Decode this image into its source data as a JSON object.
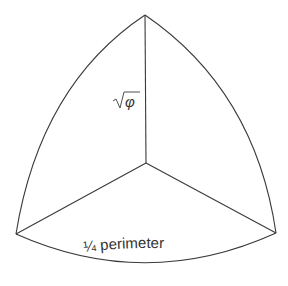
{
  "diagram": {
    "shape": "Reuleaux-like curved triangle (spherical octant view)",
    "labels": {
      "radius": "φ",
      "radius_prefix": "√",
      "arc": "¼ perimeter"
    },
    "colors": {
      "stroke": "#3a3a3a",
      "text": "#333333",
      "background": "#ffffff"
    }
  }
}
